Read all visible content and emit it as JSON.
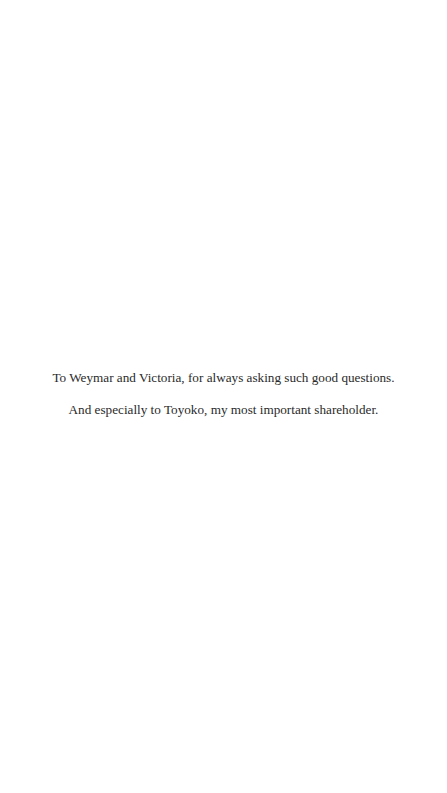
{
  "dedication": {
    "lines": [
      "To Weymar and Victoria, for always asking such good questions.",
      "And especially to Toyoko, my most important shareholder."
    ]
  }
}
